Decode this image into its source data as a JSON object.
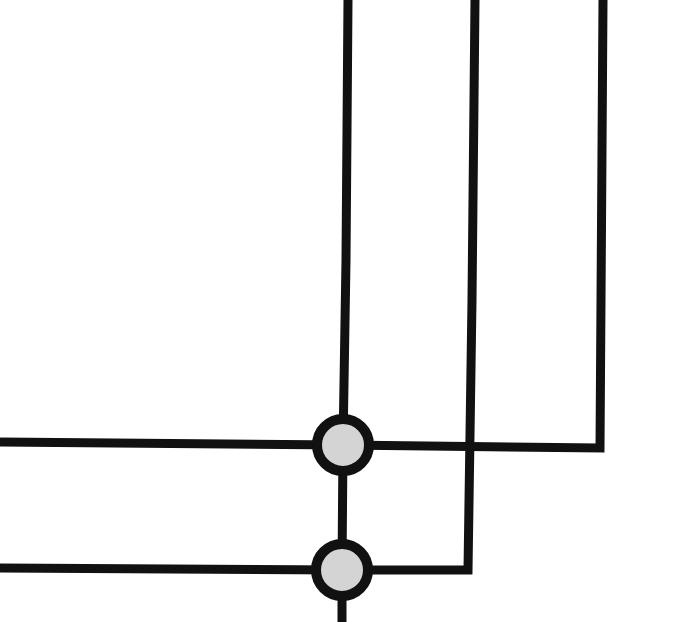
{
  "diagram": {
    "type": "wiring-crossbar",
    "background": "#ffffff",
    "wire_color": "#111111",
    "node_fill": "#d4d4d4",
    "node_stroke": "#111111",
    "vertical_wires": [
      {
        "id": "v1",
        "x": 346,
        "y_top": 0,
        "y_bottom": 622,
        "bend": null
      },
      {
        "id": "v2",
        "x": 474,
        "y_top": 0,
        "y_bottom": 570,
        "bend": "left"
      },
      {
        "id": "v3",
        "x": 600,
        "y_top": 0,
        "y_bottom": 448,
        "bend": "left"
      }
    ],
    "horizontal_wires": [
      {
        "id": "h1",
        "y": 445,
        "x_left": 0,
        "x_right": 600
      },
      {
        "id": "h2",
        "y": 570,
        "x_left": 0,
        "x_right": 468
      }
    ],
    "nodes": [
      {
        "id": "n1",
        "cx": 343,
        "cy": 445,
        "r": 26
      },
      {
        "id": "n2",
        "cx": 342,
        "cy": 570,
        "r": 26
      }
    ]
  }
}
